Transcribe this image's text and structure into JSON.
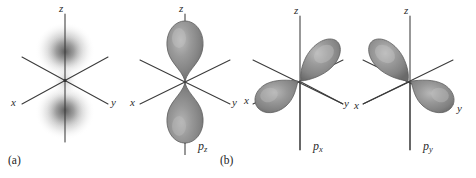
{
  "figure": {
    "background_color": "#ffffff",
    "lobe_color": "#8a8a8a",
    "lobe_highlight_color": "#b4b4b4",
    "lobe_edge_color": "#5e5e5e",
    "axis_color": "#3b3b3b",
    "cloud_color": "#8d8d8d"
  },
  "panels": [
    {
      "key": "a",
      "panel_label": "(a)",
      "orbital_label": "",
      "orbital_subscript": "",
      "representation": "electron-density-cloud",
      "axes": {
        "z": "z",
        "x": "x",
        "y": "y"
      }
    },
    {
      "key": "b1",
      "panel_label": "",
      "orbital_label": "p",
      "orbital_subscript": "z",
      "representation": "boundary-surface-lobes",
      "lobe_axis": "z",
      "axes": {
        "z": "z",
        "x": "x",
        "y": "y"
      }
    },
    {
      "key": "b2",
      "panel_label": "(b)",
      "orbital_label": "p",
      "orbital_subscript": "x",
      "representation": "boundary-surface-lobes",
      "lobe_axis": "x",
      "axes": {
        "z": "z",
        "x": "x",
        "y": "y"
      }
    },
    {
      "key": "b3",
      "panel_label": "",
      "orbital_label": "p",
      "orbital_subscript": "y",
      "representation": "boundary-surface-lobes",
      "lobe_axis": "y",
      "axes": {
        "z": "z",
        "x": "x",
        "y": "y"
      }
    }
  ]
}
